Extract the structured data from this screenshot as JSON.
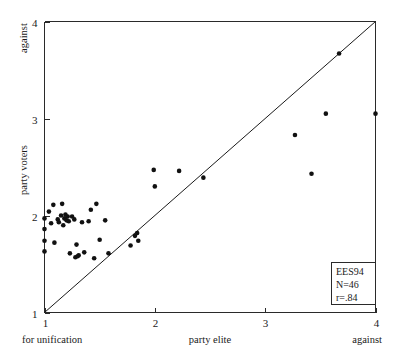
{
  "chart_data": {
    "type": "scatter",
    "title": "",
    "xlabel": "party elite",
    "ylabel": "party voters",
    "xlim": [
      1,
      4
    ],
    "ylim": [
      1,
      4
    ],
    "xticks": [
      1,
      2,
      3,
      4
    ],
    "yticks": [
      1,
      2,
      3,
      4
    ],
    "xtick_labels": [
      "1",
      "2",
      "3",
      "4"
    ],
    "ytick_labels": [
      "1",
      "2",
      "3",
      "4"
    ],
    "x_axis_low_label": "for unification",
    "x_axis_high_label": "against",
    "y_axis_high_label": "against",
    "grid": false,
    "legend": "none",
    "reference_line": {
      "type": "identity",
      "from": [
        1,
        1
      ],
      "to": [
        4,
        4
      ],
      "description": "45 degree diagonal"
    },
    "annotations": [
      {
        "text": "EES94"
      },
      {
        "text": "N=46"
      },
      {
        "text": "r=.84"
      }
    ],
    "points": [
      {
        "x": 1.0,
        "y": 1.97
      },
      {
        "x": 1.0,
        "y": 1.86
      },
      {
        "x": 1.0,
        "y": 1.74
      },
      {
        "x": 1.0,
        "y": 1.63
      },
      {
        "x": 1.04,
        "y": 2.04
      },
      {
        "x": 1.06,
        "y": 1.92
      },
      {
        "x": 1.08,
        "y": 2.11
      },
      {
        "x": 1.09,
        "y": 1.72
      },
      {
        "x": 1.12,
        "y": 1.96
      },
      {
        "x": 1.13,
        "y": 1.93
      },
      {
        "x": 1.15,
        "y": 2.0
      },
      {
        "x": 1.16,
        "y": 2.12
      },
      {
        "x": 1.17,
        "y": 1.9
      },
      {
        "x": 1.18,
        "y": 1.97
      },
      {
        "x": 1.19,
        "y": 2.01
      },
      {
        "x": 1.2,
        "y": 1.95
      },
      {
        "x": 1.21,
        "y": 1.99
      },
      {
        "x": 1.22,
        "y": 1.94
      },
      {
        "x": 1.23,
        "y": 1.61
      },
      {
        "x": 1.25,
        "y": 1.99
      },
      {
        "x": 1.27,
        "y": 1.96
      },
      {
        "x": 1.28,
        "y": 1.57
      },
      {
        "x": 1.29,
        "y": 1.7
      },
      {
        "x": 1.3,
        "y": 1.58
      },
      {
        "x": 1.31,
        "y": 1.59
      },
      {
        "x": 1.34,
        "y": 1.93
      },
      {
        "x": 1.36,
        "y": 1.62
      },
      {
        "x": 1.4,
        "y": 1.94
      },
      {
        "x": 1.42,
        "y": 2.06
      },
      {
        "x": 1.45,
        "y": 1.56
      },
      {
        "x": 1.47,
        "y": 2.12
      },
      {
        "x": 1.5,
        "y": 1.75
      },
      {
        "x": 1.55,
        "y": 1.95
      },
      {
        "x": 1.58,
        "y": 1.61
      },
      {
        "x": 1.78,
        "y": 1.69
      },
      {
        "x": 1.82,
        "y": 1.79
      },
      {
        "x": 1.84,
        "y": 1.82
      },
      {
        "x": 1.85,
        "y": 1.74
      },
      {
        "x": 1.99,
        "y": 2.47
      },
      {
        "x": 2.0,
        "y": 2.3
      },
      {
        "x": 2.22,
        "y": 2.46
      },
      {
        "x": 2.44,
        "y": 2.39
      },
      {
        "x": 3.27,
        "y": 2.83
      },
      {
        "x": 3.42,
        "y": 2.43
      },
      {
        "x": 3.55,
        "y": 3.05
      },
      {
        "x": 3.67,
        "y": 3.67
      },
      {
        "x": 4.0,
        "y": 3.05
      }
    ]
  }
}
